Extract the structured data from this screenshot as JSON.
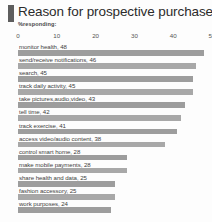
{
  "header": {
    "title": "Reason for prospective purchase",
    "subtitle": "%responding:",
    "accent_color": "#5e5e5e"
  },
  "chart_data": {
    "type": "bar",
    "orientation": "horizontal",
    "title": "Reason for prospective purchase",
    "subtitle": "%responding:",
    "xlabel": "",
    "ylabel": "",
    "xlim": [
      0,
      50
    ],
    "xticks": [
      0,
      10,
      20,
      30,
      40,
      50
    ],
    "grid": false,
    "legend": false,
    "bar_color": "#9d9d9d",
    "label_format": "category, value",
    "categories": [
      "monitor health",
      "send/receive notifications",
      "search",
      "track daily activity",
      "take pictures,audio,video",
      "tell time",
      "track exercise",
      "access video/audio content",
      "control smart home",
      "make mobile payments",
      "share health and data",
      "fashion accessory",
      "work purposes"
    ],
    "values": [
      48,
      46,
      45,
      45,
      43,
      42,
      41,
      38,
      28,
      28,
      25,
      25,
      24
    ],
    "bars": [
      {
        "label": "monitor health, 48",
        "category": "monitor health",
        "value": 48
      },
      {
        "label": "send/receive notifications, 46",
        "category": "send/receive notifications",
        "value": 46
      },
      {
        "label": "search, 45",
        "category": "search",
        "value": 45
      },
      {
        "label": "track daily activity, 45",
        "category": "track daily activity",
        "value": 45
      },
      {
        "label": "take pictures,audio,video, 43",
        "category": "take pictures,audio,video",
        "value": 43
      },
      {
        "label": "tell time, 42",
        "category": "tell time",
        "value": 42
      },
      {
        "label": "track exercise, 41",
        "category": "track exercise",
        "value": 41
      },
      {
        "label": "access video/audio content, 38",
        "category": "access video/audio content",
        "value": 38
      },
      {
        "label": "control smart home, 28",
        "category": "control smart home",
        "value": 28
      },
      {
        "label": "make mobile payments, 28",
        "category": "make mobile payments",
        "value": 28
      },
      {
        "label": "share health and data, 25",
        "category": "share health and data",
        "value": 25
      },
      {
        "label": "fashion accessory, 25",
        "category": "fashion accessory",
        "value": 25
      },
      {
        "label": "work purposes, 24",
        "category": "work purposes",
        "value": 24
      }
    ]
  }
}
